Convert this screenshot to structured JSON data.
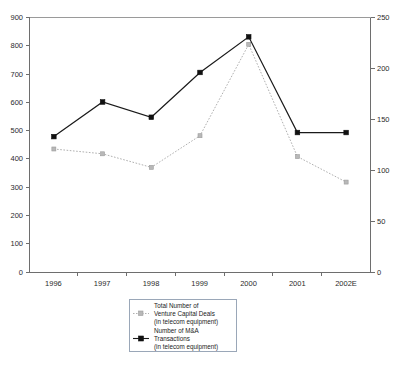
{
  "chart_data": {
    "type": "line",
    "title": "",
    "subtitle": "",
    "xlabel": "",
    "ylabel": "",
    "categories": [
      "1996",
      "1997",
      "1998",
      "1999",
      "2000",
      "2001",
      "2002E"
    ],
    "grid": false,
    "legend_position": "bottom-center",
    "axes": {
      "left": {
        "label": "",
        "min": 0,
        "max": 900,
        "step": 100,
        "ticks": [
          "0",
          "100",
          "200",
          "300",
          "400",
          "500",
          "600",
          "700",
          "800",
          "900"
        ]
      },
      "right": {
        "label": "",
        "min": 0,
        "max": 250,
        "step": 50,
        "ticks": [
          "0",
          "50",
          "100",
          "150",
          "200",
          "250"
        ]
      },
      "x": {
        "ticks": [
          "1996",
          "1997",
          "1998",
          "1999",
          "2000",
          "2001",
          "2002E"
        ]
      }
    },
    "series": [
      {
        "name": "vc-deals",
        "axis": "left",
        "color": "#b0b0b0",
        "marker": "square",
        "line_style": "dotted",
        "legend_lines": [
          "Total Number of",
          "Venture Capital Deals",
          "(in telecom equipment)"
        ],
        "values": [
          435,
          418,
          370,
          482,
          805,
          408,
          318
        ]
      },
      {
        "name": "ma-transactions",
        "axis": "right",
        "color": "#1a1a1a",
        "marker": "square",
        "line_style": "solid",
        "legend_lines": [
          "Number of M&A",
          "Transactions",
          "(in telecom equipment)"
        ],
        "values": [
          133,
          167,
          152,
          196,
          231,
          137,
          137
        ]
      }
    ]
  },
  "legend": {
    "entries": [
      {
        "line1": "Total Number of",
        "line2": "Venture Capital Deals",
        "line3": "(in telecom equipment)"
      },
      {
        "line1": "Number of M&A",
        "line2": "Transactions",
        "line3": "(in telecom equipment)"
      }
    ]
  }
}
